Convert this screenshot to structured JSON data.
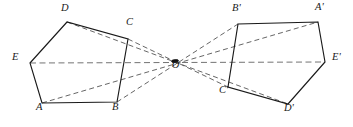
{
  "figure": {
    "background_color": "#ffffff",
    "solid_stroke_color": "#1a1a1a",
    "dashed_stroke_color": "#4a4a4a",
    "center_label": "O",
    "center_point": {
      "x": 175,
      "y": 62
    },
    "labels": {
      "A": "A",
      "B": "B",
      "C": "C",
      "D": "D",
      "E": "E",
      "O": "O",
      "Ap": "A'",
      "Bp": "B'",
      "Cp": "C'",
      "Dp": "D'",
      "Ep": "E'"
    },
    "label_positions": {
      "A": {
        "x": 36,
        "y": 106
      },
      "B": {
        "x": 112,
        "y": 106
      },
      "C": {
        "x": 126,
        "y": 21
      },
      "D": {
        "x": 61,
        "y": 7
      },
      "E": {
        "x": 12,
        "y": 56
      },
      "O": {
        "x": 172,
        "y": 64
      },
      "Ap": {
        "x": 315,
        "y": 6
      },
      "Bp": {
        "x": 232,
        "y": 7
      },
      "Cp": {
        "x": 219,
        "y": 89
      },
      "Dp": {
        "x": 284,
        "y": 107
      },
      "Ep": {
        "x": 332,
        "y": 56
      }
    },
    "pentagon_left": {
      "name": "ABCDE",
      "vertices": [
        {
          "id": "A",
          "x": 42,
          "y": 103
        },
        {
          "id": "B",
          "x": 117,
          "y": 102
        },
        {
          "id": "C",
          "x": 128,
          "y": 39
        },
        {
          "id": "D",
          "x": 67,
          "y": 22
        },
        {
          "id": "E",
          "x": 30,
          "y": 63
        }
      ]
    },
    "pentagon_right": {
      "name": "A'B'C'D'E'",
      "vertices": [
        {
          "id": "Ap",
          "x": 318,
          "y": 22
        },
        {
          "id": "Bp",
          "x": 238,
          "y": 24
        },
        {
          "id": "Cp",
          "x": 228,
          "y": 87
        },
        {
          "id": "Dp",
          "x": 288,
          "y": 104
        },
        {
          "id": "Ep",
          "x": 325,
          "y": 62
        }
      ]
    },
    "symmetry_rays": [
      {
        "id": "ray-A-Ap",
        "from": "A",
        "to": "Ap"
      },
      {
        "id": "ray-B-Bp",
        "from": "B",
        "to": "Bp"
      },
      {
        "id": "ray-C-Cp",
        "from": "C",
        "to": "Cp"
      },
      {
        "id": "ray-D-Dp",
        "from": "D",
        "to": "Dp"
      },
      {
        "id": "ray-E-Ep",
        "from": "E",
        "to": "Ep"
      }
    ]
  }
}
